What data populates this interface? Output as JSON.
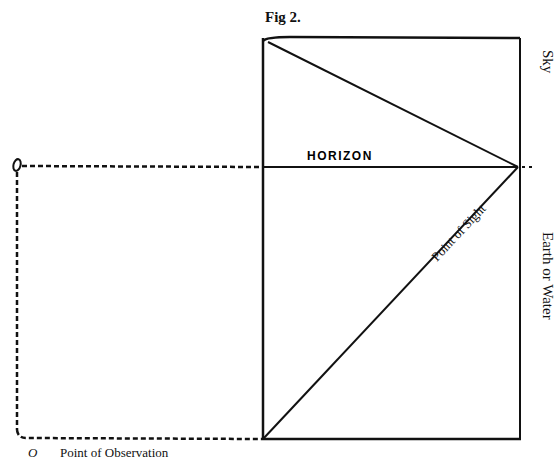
{
  "figure": {
    "caption": "Fig 2.",
    "labels": {
      "horizon": "HORIZON",
      "sky": "Sky",
      "earth_or_water": "Earth or Water",
      "point_of_sight": "Point of Sight",
      "observer_marker": "O",
      "point_of_observation": "Point of Observation"
    },
    "geometry": {
      "picture_plane": {
        "x1": 262,
        "y1": 38,
        "x2": 520,
        "y2": 440
      },
      "horizon_y": 167,
      "point_of_sight": {
        "x": 518,
        "y": 167
      },
      "observer": {
        "x": 17,
        "y": 165
      }
    }
  }
}
